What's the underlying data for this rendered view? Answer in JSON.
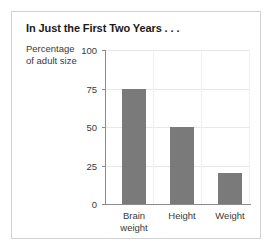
{
  "chart_data": {
    "type": "bar",
    "title": "In Just the First Two Years . . .",
    "ylabel_line1": "Percentage",
    "ylabel_line2": "of adult size",
    "xlabel": "",
    "categories": [
      "Brain weight",
      "Height",
      "Weight"
    ],
    "category_lines": [
      [
        "Brain",
        "weight"
      ],
      [
        "Height"
      ],
      [
        "Weight"
      ]
    ],
    "values": [
      75,
      50,
      20
    ],
    "ylim": [
      0,
      100
    ],
    "yticks": [
      0,
      25,
      50,
      75,
      100
    ],
    "ytick_labels": [
      "0",
      "25",
      "50",
      "75",
      "100"
    ],
    "grid": true,
    "legend": false,
    "bar_color": "#7a7a7a",
    "axis_color": "#8c8c8c",
    "grid_color": "#e8e8e8",
    "frame_color": "#d2d2d2",
    "background": "#ffffff"
  }
}
